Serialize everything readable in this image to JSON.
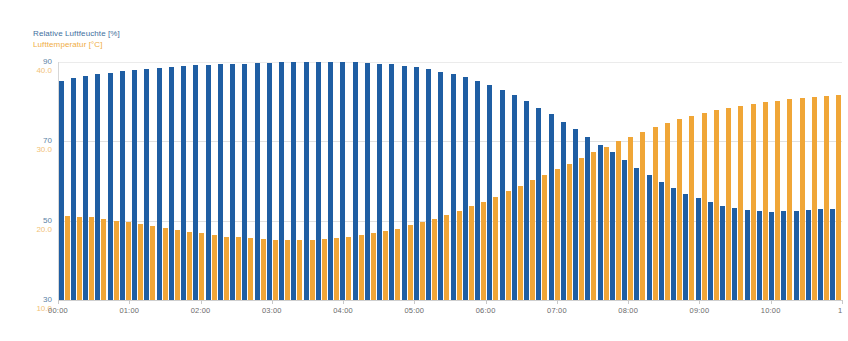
{
  "legend": {
    "humidity": "Relative Luftfeuchte [%]",
    "temperature": "Lufttemperatur [°C]"
  },
  "colors": {
    "humidity_bar": "#1f5ea3",
    "temperature_bar": "#f0a637",
    "humidity_label": "#5b7fa6",
    "temperature_label": "#f2c277",
    "grid": "#c9c9c9",
    "background": "#ffffff"
  },
  "chart_data": {
    "type": "bar",
    "title": "",
    "xlabel": "",
    "ylabel": "Relative Luftfeuchte [%]",
    "grid": true,
    "legend_position": "top-left",
    "x_tick_labels": [
      "00:00",
      "01:00",
      "02:00",
      "03:00",
      "04:00",
      "05:00",
      "06:00",
      "07:00",
      "08:00",
      "09:00",
      "10:00",
      "1"
    ],
    "x_range": [
      "00:00",
      "11:00"
    ],
    "y_axes": [
      {
        "name": "Relative Luftfeuchte [%]",
        "unit": "%",
        "color": "#5b7fa6",
        "tick_labels": [
          "90",
          "70",
          "50",
          "30"
        ],
        "tick_values": [
          90,
          70,
          50,
          30
        ],
        "ylim": [
          30,
          90
        ]
      },
      {
        "name": "Lufttemperatur [°C]",
        "unit": "°C",
        "color": "#f2c277",
        "tick_labels": [
          "40.0",
          "30.0",
          "20.0",
          "10.0"
        ],
        "tick_values": [
          40.0,
          30.0,
          20.0,
          10.0
        ],
        "ylim": [
          10.0,
          40.0
        ]
      }
    ],
    "series": [
      {
        "name": "Relative Luftfeuchte [%]",
        "axis": 0,
        "color": "#1f5ea3",
        "unit": "%",
        "values": [
          85.3,
          85.9,
          86.4,
          86.9,
          87.3,
          87.7,
          88.0,
          88.3,
          88.6,
          88.8,
          89.0,
          89.2,
          89.3,
          89.4,
          89.5,
          89.6,
          89.7,
          89.8,
          89.9,
          89.9,
          90.0,
          90.0,
          90.0,
          90.0,
          89.9,
          89.8,
          89.6,
          89.4,
          89.1,
          88.7,
          88.2,
          87.6,
          86.9,
          86.1,
          85.2,
          84.1,
          82.9,
          81.6,
          80.1,
          78.5,
          76.8,
          75.0,
          73.1,
          71.2,
          69.2,
          67.2,
          65.2,
          63.3,
          61.5,
          59.8,
          58.2,
          56.8,
          55.6,
          54.6,
          53.8,
          53.2,
          52.7,
          52.4,
          52.3,
          52.4,
          52.5,
          52.7,
          52.9,
          53.0
        ]
      },
      {
        "name": "Lufttemperatur [°C]",
        "axis": 1,
        "color": "#f0a637",
        "unit": "°C",
        "values": [
          20.6,
          20.5,
          20.4,
          20.2,
          20.0,
          19.8,
          19.6,
          19.3,
          19.1,
          18.8,
          18.6,
          18.4,
          18.2,
          18.0,
          17.9,
          17.8,
          17.7,
          17.6,
          17.6,
          17.6,
          17.6,
          17.7,
          17.8,
          18.0,
          18.2,
          18.4,
          18.7,
          19.0,
          19.4,
          19.8,
          20.2,
          20.7,
          21.2,
          21.8,
          22.4,
          23.0,
          23.7,
          24.4,
          25.1,
          25.8,
          26.5,
          27.2,
          27.9,
          28.6,
          29.3,
          30.0,
          30.6,
          31.2,
          31.8,
          32.3,
          32.8,
          33.2,
          33.6,
          33.9,
          34.2,
          34.5,
          34.7,
          34.9,
          35.1,
          35.3,
          35.4,
          35.6,
          35.7,
          35.8
        ]
      }
    ]
  }
}
